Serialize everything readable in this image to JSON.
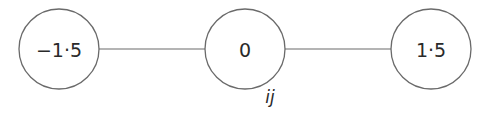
{
  "diagram": {
    "type": "linear-node-chain",
    "nodes": [
      {
        "id": "left",
        "label": "−1·5",
        "cx": 59,
        "cy": 49,
        "r": 40
      },
      {
        "id": "center",
        "label": "0",
        "cx": 245,
        "cy": 49,
        "r": 40
      },
      {
        "id": "right",
        "label": "1·5",
        "cx": 431,
        "cy": 49,
        "r": 40
      }
    ],
    "edges": [
      {
        "from": "left",
        "to": "center"
      },
      {
        "from": "center",
        "to": "right"
      }
    ],
    "caption": {
      "text": "ij",
      "x": 270,
      "y": 103
    }
  },
  "colors": {
    "stroke": "#6a6a6a",
    "text": "#2a2a2a",
    "background": "#ffffff"
  }
}
